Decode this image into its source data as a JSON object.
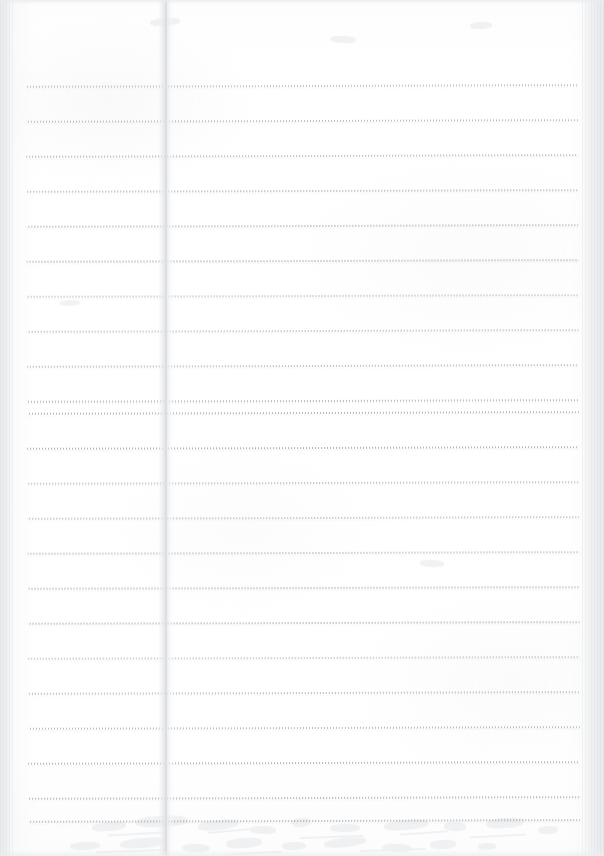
{
  "document": {
    "type": "scanned-page",
    "content_description": "Blank ruled notebook page, scanned",
    "width": 604,
    "height": 856,
    "text_content": "",
    "visible_text": []
  },
  "paper": {
    "background_color": "#ffffff",
    "surface_tint": "#fdfdfd"
  },
  "ruling": {
    "style": "dotted",
    "line_color": "#76787e",
    "dot_pitch_px": 3,
    "line_thickness_px": 2,
    "line_start_x": 27,
    "line_end_x": 579,
    "line_spacing_px": 35,
    "skew_degrees": -0.18,
    "line_count": 22,
    "line_y_positions": [
      85,
      120,
      155,
      190,
      225,
      260,
      295,
      330,
      365,
      400,
      412,
      447,
      482,
      517,
      552,
      587,
      622,
      657,
      692,
      727,
      762,
      797,
      820
    ]
  },
  "crease": {
    "name": "binding-fold",
    "x_position": 158,
    "width_px": 16,
    "core_color": "#dddee2",
    "band_color": "#e2e3e6"
  },
  "scan_edges": {
    "left": {
      "x": 0,
      "width": 13,
      "color": "#e9eaec"
    },
    "right": {
      "x": 582,
      "width": 22,
      "color": "#e7e8ea"
    },
    "top": {
      "y": 0,
      "height": 4,
      "color": "#eaebee"
    },
    "bottom": {
      "y": 850,
      "height": 6,
      "color": "#ecedf0"
    }
  },
  "bleed_through": {
    "description": "Faint ghost of handwriting from the reverse side of the sheet",
    "color": "#dee0e4",
    "opacity": 0.4,
    "marks": [
      {
        "x": 92,
        "y": 822,
        "w": 34,
        "h": 9,
        "rot": -5
      },
      {
        "x": 136,
        "y": 816,
        "w": 52,
        "h": 11,
        "rot": -3
      },
      {
        "x": 198,
        "y": 820,
        "w": 40,
        "h": 10,
        "rot": -6
      },
      {
        "x": 250,
        "y": 826,
        "w": 26,
        "h": 8,
        "rot": 2
      },
      {
        "x": 292,
        "y": 818,
        "w": 18,
        "h": 9,
        "rot": -4
      },
      {
        "x": 330,
        "y": 824,
        "w": 30,
        "h": 8,
        "rot": -2
      },
      {
        "x": 384,
        "y": 820,
        "w": 44,
        "h": 10,
        "rot": -5
      },
      {
        "x": 444,
        "y": 822,
        "w": 22,
        "h": 9,
        "rot": 3
      },
      {
        "x": 486,
        "y": 818,
        "w": 38,
        "h": 10,
        "rot": -4
      },
      {
        "x": 538,
        "y": 826,
        "w": 20,
        "h": 8,
        "rot": -2
      },
      {
        "x": 70,
        "y": 842,
        "w": 30,
        "h": 8,
        "rot": -3
      },
      {
        "x": 120,
        "y": 838,
        "w": 46,
        "h": 10,
        "rot": -5
      },
      {
        "x": 182,
        "y": 844,
        "w": 28,
        "h": 8,
        "rot": 2
      },
      {
        "x": 226,
        "y": 838,
        "w": 36,
        "h": 10,
        "rot": -4
      },
      {
        "x": 282,
        "y": 842,
        "w": 24,
        "h": 8,
        "rot": -1
      },
      {
        "x": 324,
        "y": 838,
        "w": 42,
        "h": 9,
        "rot": -6
      },
      {
        "x": 382,
        "y": 844,
        "w": 30,
        "h": 8,
        "rot": 3
      },
      {
        "x": 430,
        "y": 840,
        "w": 26,
        "h": 9,
        "rot": -3
      },
      {
        "x": 478,
        "y": 843,
        "w": 18,
        "h": 7,
        "rot": -2
      },
      {
        "x": 150,
        "y": 18,
        "w": 30,
        "h": 8,
        "rot": -4
      },
      {
        "x": 330,
        "y": 36,
        "w": 26,
        "h": 7,
        "rot": 3
      },
      {
        "x": 470,
        "y": 22,
        "w": 22,
        "h": 7,
        "rot": -3
      },
      {
        "x": 60,
        "y": 300,
        "w": 20,
        "h": 6,
        "rot": -2
      },
      {
        "x": 420,
        "y": 560,
        "w": 24,
        "h": 7,
        "rot": 2
      }
    ],
    "strokes": [
      {
        "x": 108,
        "y": 833,
        "w": 56,
        "rot": -3
      },
      {
        "x": 208,
        "y": 830,
        "w": 42,
        "rot": -5
      },
      {
        "x": 300,
        "y": 836,
        "w": 64,
        "rot": -2
      },
      {
        "x": 400,
        "y": 832,
        "w": 48,
        "rot": -4
      },
      {
        "x": 470,
        "y": 835,
        "w": 56,
        "rot": -3
      },
      {
        "x": 96,
        "y": 850,
        "w": 70,
        "rot": -2
      },
      {
        "x": 230,
        "y": 852,
        "w": 52,
        "rot": -3
      },
      {
        "x": 360,
        "y": 849,
        "w": 66,
        "rot": -2
      }
    ]
  }
}
